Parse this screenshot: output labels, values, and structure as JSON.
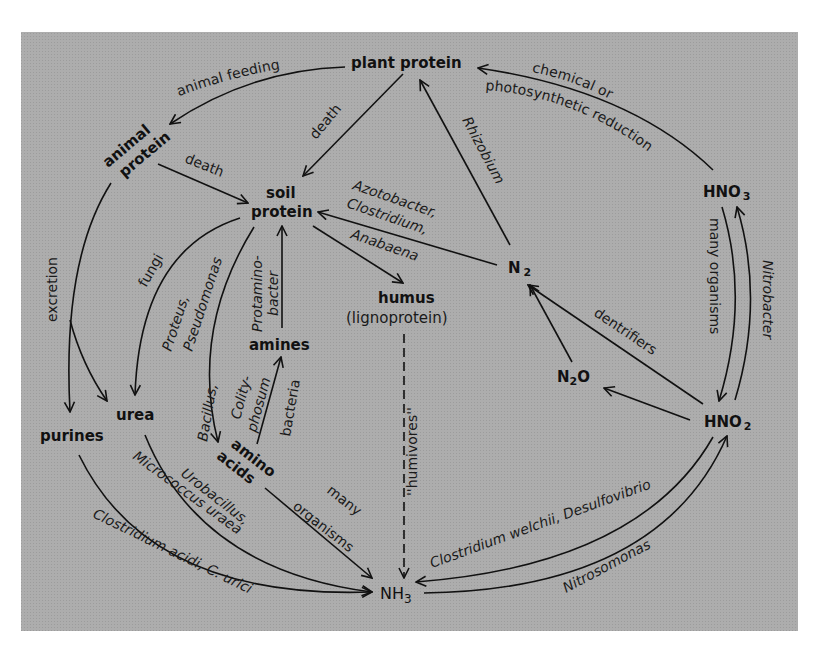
{
  "diagram": {
    "colors": {
      "background": "#a9a9a9",
      "page": "#ffffff",
      "ink": "#111111"
    },
    "nodes": {
      "plant_protein": "plant protein",
      "animal": "animal",
      "protein_word": "protein",
      "soil": "soil",
      "humus": "humus",
      "lignoprotein": "(lignoprotein)",
      "amines": "amines",
      "amino": "amino",
      "acids": "acids",
      "urea": "urea",
      "purines": "purines",
      "n2_base": "N",
      "n2_sub": "2",
      "n2o_n": "N",
      "n2o_sub": "2",
      "n2o_o": "O",
      "hno3_base": "HNO",
      "hno3_sub": "3",
      "hno2_base": "HNO",
      "hno2_sub": "2",
      "nh3_base": "NH",
      "nh3_sub": "3"
    },
    "edges": [
      {
        "from": "plant protein",
        "to": "animal protein",
        "label": "animal feeding"
      },
      {
        "from": "plant protein",
        "to": "soil protein",
        "label": "death"
      },
      {
        "from": "animal protein",
        "to": "soil protein",
        "label": "death"
      },
      {
        "from": "animal protein",
        "to": "purines / urea",
        "label": "excretion"
      },
      {
        "from": "soil protein",
        "to": "urea",
        "label": "fungi"
      },
      {
        "from": "soil protein",
        "to": "amino acids",
        "label": "Proteus, Pseudomonas / Bacillus,"
      },
      {
        "from": "amines",
        "to": "soil protein",
        "label": "Protamino- bacter"
      },
      {
        "from": "amino acids",
        "to": "amines",
        "label": "Colity- phosum bacteria"
      },
      {
        "from": "soil protein",
        "to": "humus"
      },
      {
        "from": "N2",
        "to": "soil protein",
        "label": "Azotobacter, Clostridium, Anabaena"
      },
      {
        "from": "N2",
        "to": "plant protein",
        "label": "Rhizobium"
      },
      {
        "from": "HNO3",
        "to": "plant protein",
        "label": "chemical or photosynthetic reduction"
      },
      {
        "from": "HNO3",
        "to": "HNO2",
        "label": "many organisms"
      },
      {
        "from": "HNO2",
        "to": "HNO3",
        "label": "Nitrobacter"
      },
      {
        "from": "HNO2",
        "to": "N2",
        "label": "dentrifiers"
      },
      {
        "from": "HNO2",
        "to": "N2O"
      },
      {
        "from": "N2O",
        "to": "N2"
      },
      {
        "from": "humus",
        "to": "NH3",
        "label": "''humivores''"
      },
      {
        "from": "amino acids",
        "to": "NH3",
        "label": "many organisms"
      },
      {
        "from": "urea",
        "to": "NH3",
        "label": "Urobacillus, Micrococcus uraea"
      },
      {
        "from": "purines",
        "to": "NH3",
        "label": "Clostridium acidi, C. urici"
      },
      {
        "from": "HNO2",
        "to": "NH3",
        "label": "Clostridium welchii, Desulfovibrio"
      },
      {
        "from": "NH3",
        "to": "HNO2",
        "label": "Nitrosomonas"
      }
    ],
    "labels": {
      "animal_feeding": "animal feeding",
      "death1": "death",
      "death2": "death",
      "excretion": "excretion",
      "fungi": "fungi",
      "proteus": "Proteus,",
      "pseudomonas": "Pseudomonas",
      "bacillus": "Bacillus,",
      "protamino": "Protamino-",
      "bacter": "bacter",
      "colity": "Colity-",
      "phosum": "phosum",
      "bacteria": "bacteria",
      "azotobacter": "Azotobacter,",
      "clostridium": "Clostridium,",
      "anabaena": "Anabaena",
      "rhizobium": "Rhizobium",
      "chemical_or": "chemical or",
      "photosynthetic": "photosynthetic reduction",
      "many_organisms_right": "many organisms",
      "nitrobacter": "Nitrobacter",
      "dentrifiers": "dentrifiers",
      "humivores": "''humivores''",
      "many": "many",
      "organisms": "organisms",
      "urobacillus": "Urobacillus,",
      "micrococcus": "Micrococcus uraea",
      "clostridium_acidi": "Clostridium acidi, C. urici",
      "clostridium_welchii": "Clostridium welchii, Desulfovibrio",
      "nitrosomonas": "Nitrosomonas"
    }
  }
}
